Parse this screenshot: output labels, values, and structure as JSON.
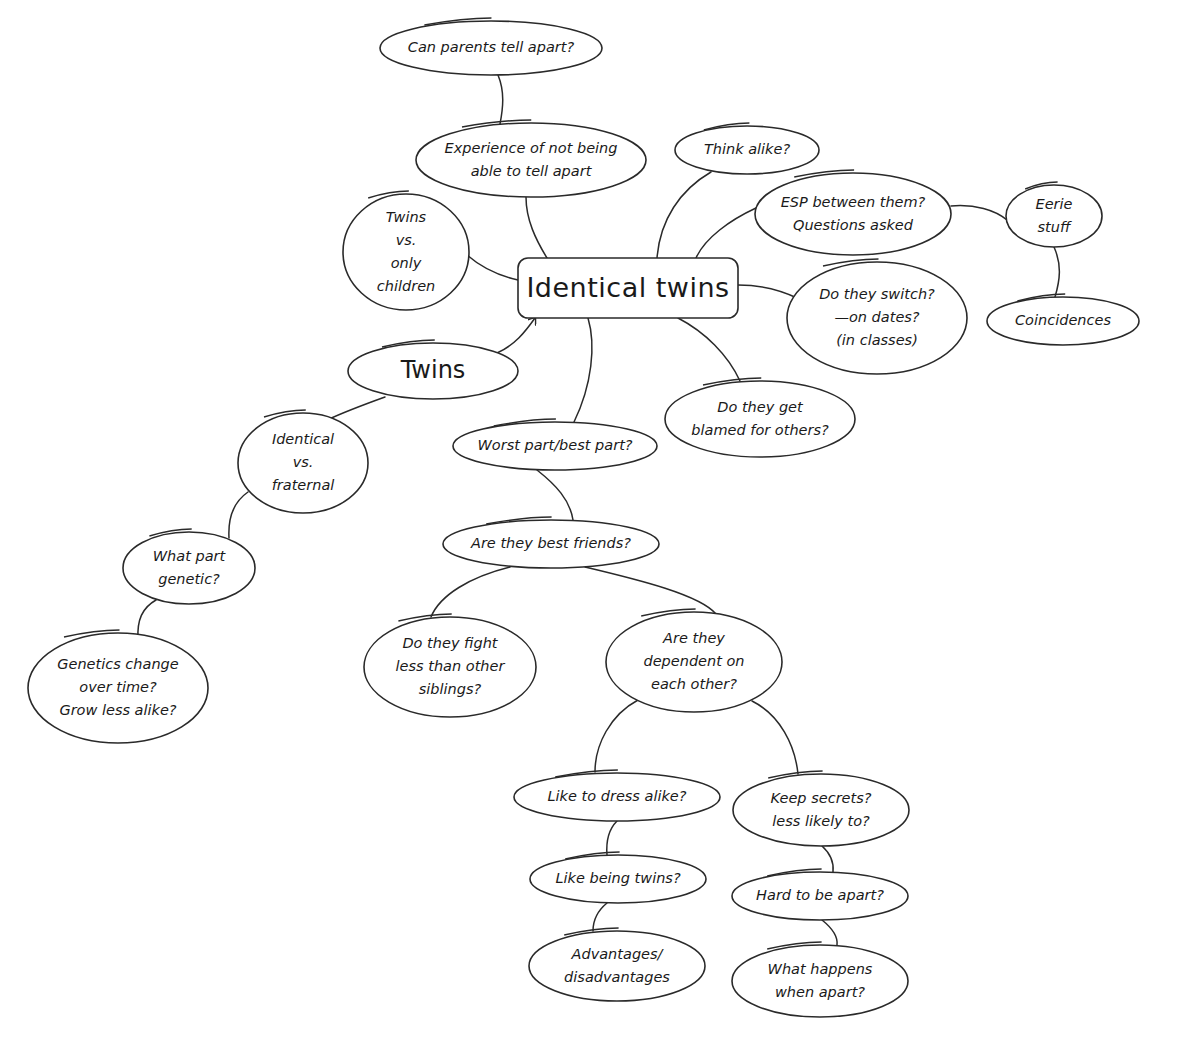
{
  "diagram": {
    "type": "mind-map",
    "background": "#ffffff",
    "stroke_color": "#2a2a2a",
    "central": {
      "id": "identical-twins",
      "label": "Identical twins",
      "shape": "rounded-rect",
      "x": 518,
      "y": 258,
      "w": 220,
      "h": 60
    },
    "nodes": [
      {
        "id": "can-parents",
        "lines": [
          "Can parents tell apart?"
        ],
        "cx": 491,
        "cy": 48,
        "rx": 111,
        "ry": 27
      },
      {
        "id": "experience",
        "lines": [
          "Experience of not being",
          "able to tell apart"
        ],
        "cx": 531,
        "cy": 160,
        "rx": 115,
        "ry": 37
      },
      {
        "id": "twins-vs-only",
        "lines": [
          "Twins",
          "vs.",
          "only",
          "children"
        ],
        "cx": 406,
        "cy": 252,
        "rx": 63,
        "ry": 58
      },
      {
        "id": "think-alike",
        "lines": [
          "Think alike?"
        ],
        "cx": 747,
        "cy": 150,
        "rx": 72,
        "ry": 24
      },
      {
        "id": "esp",
        "lines": [
          "ESP between them?",
          "Questions asked"
        ],
        "cx": 853,
        "cy": 214,
        "rx": 98,
        "ry": 41
      },
      {
        "id": "eerie",
        "lines": [
          "Eerie",
          "stuff"
        ],
        "cx": 1054,
        "cy": 216,
        "rx": 48,
        "ry": 31
      },
      {
        "id": "coincidences",
        "lines": [
          "Coincidences"
        ],
        "cx": 1063,
        "cy": 321,
        "rx": 76,
        "ry": 24
      },
      {
        "id": "switch",
        "lines": [
          "Do they switch?",
          "—on dates?",
          "(in classes)"
        ],
        "cx": 877,
        "cy": 318,
        "rx": 90,
        "ry": 56
      },
      {
        "id": "blamed",
        "lines": [
          "Do they get",
          "blamed for others?"
        ],
        "cx": 760,
        "cy": 419,
        "rx": 95,
        "ry": 38
      },
      {
        "id": "twins",
        "lines": [
          "Twins"
        ],
        "cx": 433,
        "cy": 371,
        "rx": 85,
        "ry": 28,
        "style": "twins"
      },
      {
        "id": "worst-best",
        "lines": [
          "Worst part/best part?"
        ],
        "cx": 555,
        "cy": 446,
        "rx": 102,
        "ry": 24
      },
      {
        "id": "identical-vs-fraternal",
        "lines": [
          "Identical",
          "vs.",
          "fraternal"
        ],
        "cx": 303,
        "cy": 463,
        "rx": 65,
        "ry": 50
      },
      {
        "id": "best-friends",
        "lines": [
          "Are they best friends?"
        ],
        "cx": 551,
        "cy": 544,
        "rx": 108,
        "ry": 24
      },
      {
        "id": "what-part-genetic",
        "lines": [
          "What part",
          "genetic?"
        ],
        "cx": 189,
        "cy": 568,
        "rx": 66,
        "ry": 36
      },
      {
        "id": "fight-less",
        "lines": [
          "Do they fight",
          "less than other",
          "siblings?"
        ],
        "cx": 450,
        "cy": 667,
        "rx": 86,
        "ry": 50
      },
      {
        "id": "dependent",
        "lines": [
          "Are they",
          "dependent on",
          "each other?"
        ],
        "cx": 694,
        "cy": 662,
        "rx": 88,
        "ry": 50
      },
      {
        "id": "genetics-change",
        "lines": [
          "Genetics  change",
          "over time?",
          "Grow less alike?"
        ],
        "cx": 118,
        "cy": 688,
        "rx": 90,
        "ry": 55
      },
      {
        "id": "dress-alike",
        "lines": [
          "Like to dress alike?"
        ],
        "cx": 617,
        "cy": 797,
        "rx": 103,
        "ry": 24
      },
      {
        "id": "keep-secrets",
        "lines": [
          "Keep secrets?",
          "less likely to?"
        ],
        "cx": 821,
        "cy": 810,
        "rx": 88,
        "ry": 36
      },
      {
        "id": "like-being-twins",
        "lines": [
          "Like being twins?"
        ],
        "cx": 618,
        "cy": 879,
        "rx": 88,
        "ry": 24
      },
      {
        "id": "hard-apart",
        "lines": [
          "Hard to be apart?"
        ],
        "cx": 820,
        "cy": 896,
        "rx": 88,
        "ry": 24
      },
      {
        "id": "advantages",
        "lines": [
          "Advantages/",
          "disadvantages"
        ],
        "cx": 617,
        "cy": 966,
        "rx": 88,
        "ry": 35
      },
      {
        "id": "what-happens",
        "lines": [
          "What happens",
          "when apart?"
        ],
        "cx": 820,
        "cy": 981,
        "rx": 88,
        "ry": 36
      }
    ],
    "edges": [
      {
        "from": "can-parents",
        "to": "experience",
        "d": "M498,75 C505,92 503,108 500,124"
      },
      {
        "from": "experience",
        "to": "identical-twins",
        "d": "M526,197 C526,220 536,240 547,258"
      },
      {
        "from": "twins-vs-only",
        "to": "identical-twins",
        "d": "M467,255 C482,268 500,276 518,280"
      },
      {
        "from": "think-alike",
        "to": "identical-twins",
        "d": "M711,172 C680,190 660,220 657,258"
      },
      {
        "from": "esp",
        "to": "identical-twins",
        "d": "M756,208 C730,220 705,238 696,258"
      },
      {
        "from": "esp",
        "to": "eerie",
        "d": "M951,206 C975,204 995,210 1007,220"
      },
      {
        "from": "eerie",
        "to": "coincidences",
        "d": "M1054,247 C1062,265 1060,280 1055,297"
      },
      {
        "from": "identical-twins",
        "to": "switch",
        "d": "M738,285 C760,285 780,290 797,298"
      },
      {
        "from": "identical-twins",
        "to": "blamed",
        "d": "M678,318 C705,332 728,355 740,381"
      },
      {
        "from": "twins",
        "to": "identical-twins",
        "d": "M497,353 C515,345 525,332 535,318",
        "arrow": true
      },
      {
        "from": "identical-twins",
        "to": "worst-best",
        "d": "M588,318 C596,345 592,385 574,422"
      },
      {
        "from": "twins",
        "to": "identical-vs-fraternal",
        "d": "M385,397 C360,406 340,414 327,420"
      },
      {
        "from": "worst-best",
        "to": "best-friends",
        "d": "M537,470 C556,485 570,500 573,520"
      },
      {
        "from": "identical-vs-fraternal",
        "to": "what-part-genetic",
        "d": "M248,492 C232,503 228,520 229,538"
      },
      {
        "from": "best-friends",
        "to": "fight-less",
        "d": "M510,567 C470,577 440,595 431,617"
      },
      {
        "from": "best-friends",
        "to": "dependent",
        "d": "M585,567 C640,580 700,595 716,614"
      },
      {
        "from": "what-part-genetic",
        "to": "genetics-change",
        "d": "M156,600 C142,608 137,620 138,639"
      },
      {
        "from": "dependent",
        "to": "dress-alike",
        "d": "M638,700 C610,715 595,745 595,772"
      },
      {
        "from": "dependent",
        "to": "keep-secrets",
        "d": "M752,701 C780,715 795,745 798,774"
      },
      {
        "from": "dress-alike",
        "to": "like-being-twins",
        "d": "M617,821 C608,830 606,842 607,855"
      },
      {
        "from": "keep-secrets",
        "to": "hard-apart",
        "d": "M822,846 C832,855 834,863 833,872"
      },
      {
        "from": "like-being-twins",
        "to": "advantages",
        "d": "M607,903 C596,912 593,922 593,931"
      },
      {
        "from": "hard-apart",
        "to": "what-happens",
        "d": "M822,920 C832,928 838,937 837,945"
      }
    ]
  }
}
